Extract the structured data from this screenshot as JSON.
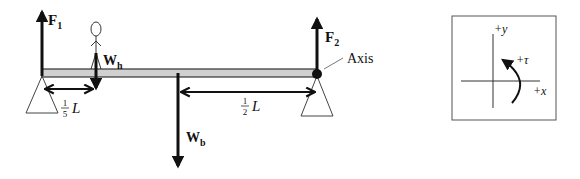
{
  "diagram": {
    "colors": {
      "ink": "#111111",
      "beam_fill": "#d0d0d0",
      "beam_stroke": "#333333",
      "support_stroke": "#444444",
      "background": "#ffffff"
    },
    "forces": {
      "f1": {
        "main": "F",
        "sub": "1",
        "direction": "up"
      },
      "f2": {
        "main": "F",
        "sub": "2",
        "direction": "up"
      },
      "wh": {
        "main": "W",
        "sub": "h",
        "direction": "down"
      },
      "wb": {
        "main": "W",
        "sub": "b",
        "direction": "down"
      }
    },
    "dimensions": {
      "left": {
        "numerator": "1",
        "denominator": "5",
        "variable": "L"
      },
      "right": {
        "numerator": "1",
        "denominator": "2",
        "variable": "L"
      }
    },
    "axis_label": "Axis",
    "coordinate_box": {
      "y_label": "+y",
      "x_label": "+x",
      "torque_label": "+τ"
    }
  }
}
